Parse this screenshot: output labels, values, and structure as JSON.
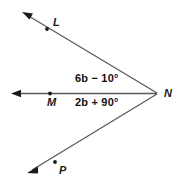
{
  "figure": {
    "background_color": "#ffffff",
    "line_color": "#5a5a5a",
    "text_color": "#111111",
    "point_color": "#1a1a1a"
  },
  "points": {
    "L": {
      "label": "L",
      "x": 47,
      "y": 29
    },
    "M": {
      "label": "M",
      "x": 50,
      "y": 94
    },
    "N": {
      "label": "N",
      "x": 157,
      "y": 93
    },
    "P": {
      "label": "P",
      "x": 55,
      "y": 162
    }
  },
  "rays": [
    {
      "name": "ray-LN",
      "from": "N",
      "through": "L",
      "arrow_at": {
        "x": 24,
        "y": 13
      }
    },
    {
      "name": "ray-MN",
      "from": "N",
      "through": "M",
      "arrow_at": {
        "x": 13,
        "y": 94
      }
    },
    {
      "name": "ray-PN",
      "from": "N",
      "through": "P",
      "arrow_at": {
        "x": 29,
        "y": 172
      }
    }
  ],
  "angle_labels": {
    "upper": "6b − 10°",
    "lower": "2b + 90°"
  }
}
